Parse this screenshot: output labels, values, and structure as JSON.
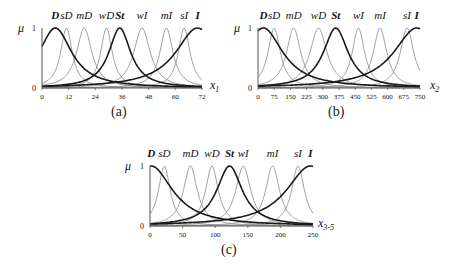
{
  "chart_data": [
    {
      "type": "line",
      "panel_caption": "(a)",
      "title": "",
      "ylabel": "μ",
      "xlabel": "x1",
      "xlabel_main": "x",
      "xlabel_sub": "1",
      "ylim": [
        0,
        1
      ],
      "xlim": [
        0,
        72
      ],
      "xticks": [
        0,
        12,
        24,
        36,
        48,
        60,
        72
      ],
      "yticks": [
        0,
        1
      ],
      "grid": false,
      "legend": "term labels above curves",
      "series": [
        {
          "name": "D",
          "peak": 6,
          "width": 9,
          "bold": true
        },
        {
          "name": "sD",
          "peak": 11,
          "width": 3.2,
          "bold": false
        },
        {
          "name": "mD",
          "peak": 19,
          "width": 4.2,
          "bold": false
        },
        {
          "name": "wD",
          "peak": 29,
          "width": 3.2,
          "bold": false
        },
        {
          "name": "St",
          "peak": 35,
          "width": 6,
          "bold": true
        },
        {
          "name": "wI",
          "peak": 45,
          "width": 4.5,
          "bold": false
        },
        {
          "name": "mI",
          "peak": 56,
          "width": 3.6,
          "bold": false
        },
        {
          "name": "sI",
          "peak": 64,
          "width": 3.2,
          "bold": false
        },
        {
          "name": "I",
          "peak": 70,
          "width": 12,
          "bold": true
        }
      ]
    },
    {
      "type": "line",
      "panel_caption": "(b)",
      "title": "",
      "ylabel": "μ",
      "xlabel": "x2",
      "xlabel_main": "x",
      "xlabel_sub": "2",
      "ylim": [
        0,
        1
      ],
      "xlim": [
        0,
        750
      ],
      "xticks": [
        0,
        75,
        150,
        225,
        300,
        375,
        450,
        525,
        600,
        675,
        750
      ],
      "yticks": [
        0,
        1
      ],
      "grid": false,
      "legend": "term labels above curves",
      "series": [
        {
          "name": "D",
          "peak": 25,
          "width": 110,
          "bold": true
        },
        {
          "name": "sD",
          "peak": 75,
          "width": 35,
          "bold": false
        },
        {
          "name": "mD",
          "peak": 165,
          "width": 40,
          "bold": false
        },
        {
          "name": "wD",
          "peak": 280,
          "width": 48,
          "bold": false
        },
        {
          "name": "St",
          "peak": 360,
          "width": 70,
          "bold": true
        },
        {
          "name": "wI",
          "peak": 465,
          "width": 35,
          "bold": false
        },
        {
          "name": "mI",
          "peak": 565,
          "width": 38,
          "bold": false
        },
        {
          "name": "sI",
          "peak": 690,
          "width": 38,
          "bold": false
        },
        {
          "name": "I",
          "peak": 735,
          "width": 130,
          "bold": true
        }
      ]
    },
    {
      "type": "line",
      "panel_caption": "(c)",
      "title": "",
      "ylabel": "μ",
      "xlabel": "x3-5",
      "xlabel_main": "x",
      "xlabel_sub": "3-5",
      "ylim": [
        0,
        1
      ],
      "xlim": [
        0,
        250
      ],
      "xticks": [
        0,
        50,
        100,
        150,
        200,
        250
      ],
      "yticks": [
        0,
        1
      ],
      "grid": false,
      "legend": "term labels above curves",
      "series": [
        {
          "name": "D",
          "peak": 2,
          "width": 40,
          "bold": true
        },
        {
          "name": "sD",
          "peak": 22,
          "width": 11,
          "bold": false
        },
        {
          "name": "mD",
          "peak": 62,
          "width": 13,
          "bold": false
        },
        {
          "name": "wD",
          "peak": 95,
          "width": 12,
          "bold": false
        },
        {
          "name": "St",
          "peak": 122,
          "width": 24,
          "bold": true
        },
        {
          "name": "wI",
          "peak": 143,
          "width": 14,
          "bold": false
        },
        {
          "name": "mI",
          "peak": 188,
          "width": 13,
          "bold": false
        },
        {
          "name": "sI",
          "peak": 227,
          "width": 12,
          "bold": false
        },
        {
          "name": "I",
          "peak": 246,
          "width": 45,
          "bold": true
        }
      ]
    }
  ],
  "layout": {
    "panels": [
      {
        "x0": 42,
        "x1": 202,
        "y0": 88,
        "y1": 28,
        "label_y": 19,
        "caption_x": 111,
        "caption_y": 104,
        "xlabel_x": 210,
        "xlabel_y": 78,
        "mu_x": 18,
        "one_x": 32,
        "zero_x": 32
      },
      {
        "x0": 258,
        "x1": 420,
        "y0": 88,
        "y1": 28,
        "label_y": 19,
        "caption_x": 328,
        "caption_y": 104,
        "xlabel_x": 430,
        "xlabel_y": 78,
        "mu_x": 234,
        "one_x": 248,
        "zero_x": 248
      },
      {
        "x0": 150,
        "x1": 313,
        "y0": 226,
        "y1": 166,
        "label_y": 157,
        "caption_x": 221,
        "caption_y": 242,
        "xlabel_x": 318,
        "xlabel_y": 216,
        "mu_x": 125,
        "one_x": 140,
        "zero_x": 140
      }
    ]
  },
  "colors": {
    "bold_curve": "#1a1a1a",
    "thin_curve": "#8a8a8a",
    "axis": "#555555",
    "text": "#111111"
  }
}
